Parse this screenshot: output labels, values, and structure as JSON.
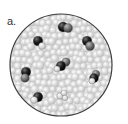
{
  "figure": {
    "panel_label": "a.",
    "colors": {
      "background_particles": "#d8d8d8",
      "dark_atom": "#1a1a1a",
      "gray_atom": "#6e6e6e",
      "white_atom": "#f2f2f2",
      "circle_border": "#444444"
    },
    "molecules": [
      {
        "name": "molecule-top",
        "atoms": [
          "dark",
          "dark_gray"
        ]
      },
      {
        "name": "molecule-upper-left",
        "atoms": [
          "dark",
          "white"
        ]
      },
      {
        "name": "molecule-upper-right",
        "atoms": [
          "dark",
          "gray"
        ]
      },
      {
        "name": "molecule-center",
        "atoms": [
          "dark",
          "gray",
          "white"
        ]
      },
      {
        "name": "molecule-left",
        "atoms": [
          "dark",
          "gray"
        ]
      },
      {
        "name": "molecule-right",
        "atoms": [
          "gray",
          "dark",
          "white"
        ]
      },
      {
        "name": "molecule-bottom-left",
        "atoms": [
          "dark",
          "white"
        ]
      },
      {
        "name": "molecule-bottom-center",
        "atoms": [
          "white",
          "white",
          "white"
        ]
      }
    ]
  }
}
